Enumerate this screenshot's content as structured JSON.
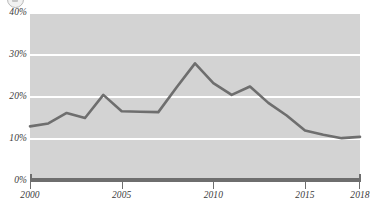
{
  "logo": {
    "icon": "partial-circle-logo"
  },
  "chart_data": {
    "type": "line",
    "title": "",
    "subtitle": "",
    "xlabel": "",
    "ylabel": "",
    "xlim": [
      2000,
      2018
    ],
    "ylim": [
      0,
      40
    ],
    "grid": true,
    "legend": "none",
    "y_ticks": [
      "0%",
      "10%",
      "20%",
      "30%",
      "40%"
    ],
    "y_tick_values": [
      0,
      10,
      20,
      30,
      40
    ],
    "x_ticks": [
      "2000",
      "2005",
      "2010",
      "2015",
      "2018"
    ],
    "x_tick_values": [
      2000,
      2005,
      2010,
      2015,
      2018
    ],
    "series": [
      {
        "name": "series-1",
        "color": "#6e6e6e",
        "x": [
          2000,
          2001,
          2002,
          2003,
          2004,
          2005,
          2006,
          2007,
          2008,
          2009,
          2010,
          2011,
          2012,
          2013,
          2014,
          2015,
          2016,
          2017,
          2018
        ],
        "values": [
          13.0,
          13.7,
          16.2,
          15.0,
          20.5,
          16.6,
          16.5,
          16.4,
          22.3,
          28.0,
          23.3,
          20.5,
          22.5,
          18.6,
          15.6,
          12.0,
          11.0,
          10.2,
          10.5
        ]
      }
    ],
    "colors": {
      "plot_background": "#d3d3d3",
      "gridline": "#ffffff",
      "line": "#6e6e6e",
      "axis": "#6e6e6e",
      "tick_label": "#3a3a3a",
      "page_background": "#ffffff"
    }
  }
}
